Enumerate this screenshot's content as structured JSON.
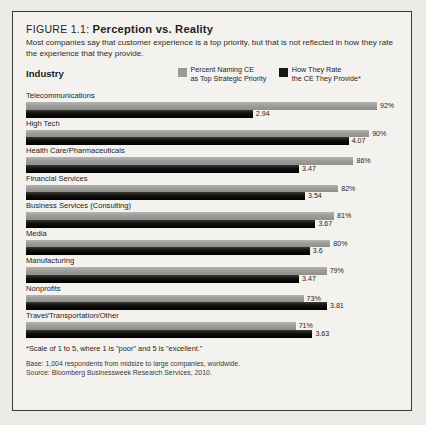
{
  "figure": {
    "number_label": "FIGURE 1.1:",
    "title": "Perception vs. Reality",
    "subtitle": "Most companies say that customer experience is a top priority, but that is not reflected in how they rate the experience that they provide."
  },
  "axis_header": "Industry",
  "legend": {
    "items": [
      {
        "label_line1": "Percent Naming CE",
        "label_line2": "as Top Strategic Priority",
        "color": "#9a9a96",
        "swatch": "gray"
      },
      {
        "label_line1": "How They Rate",
        "label_line2": "the CE They Provide*",
        "color": "#161614",
        "swatch": "black"
      }
    ]
  },
  "footnotes": {
    "scale_note": "*Scale of 1 to 5, where 1 is \"poor\" and 5 is \"excellent.\"",
    "base": "Base: 1,004 respondents from midsize to large companies, worldwide.",
    "source": "Source: Bloomberg Businessweek Research Services, 2010."
  },
  "chart_data": {
    "type": "bar",
    "title": "Perception vs. Reality",
    "subtitle": "Most companies say that customer experience is a top priority, but that is not reflected in how they rate the experience that they provide.",
    "orientation": "horizontal",
    "grid": false,
    "legend_position": "top-right",
    "xlabel": "",
    "ylabel": "Industry",
    "categories": [
      "Telecommunications",
      "High Tech",
      "Health Care/Pharmaceuticals",
      "Financial Services",
      "Business Services (Consulting)",
      "Media",
      "Manufacturing",
      "Nonprofits",
      "Travel/Transportation/Other"
    ],
    "series": [
      {
        "name": "Percent Naming CE as Top Strategic Priority",
        "color": "#9a9a96",
        "unit": "%",
        "axis_max": 100,
        "values": [
          92,
          90,
          86,
          82,
          81,
          80,
          79,
          73,
          71
        ],
        "labels": [
          "92%",
          "90%",
          "86%",
          "82%",
          "81%",
          "80%",
          "79%",
          "73%",
          "71%"
        ]
      },
      {
        "name": "How They Rate the CE They Provide",
        "color": "#161614",
        "unit": "rating",
        "axis_max": 5,
        "scale_note": "Scale of 1 to 5, where 1 is \"poor\" and 5 is \"excellent.\"",
        "values": [
          2.94,
          4.07,
          3.47,
          3.54,
          3.67,
          3.6,
          3.47,
          3.81,
          3.63
        ],
        "labels": [
          "2.94",
          "4.07",
          "3.47",
          "3.54",
          "3.67",
          "3.6",
          "3.47",
          "3.81",
          "3.63"
        ]
      }
    ],
    "rows": [
      {
        "category": "Telecommunications",
        "percent": 92,
        "percent_label": "92%",
        "rating": 2.94,
        "rating_label": "2.94",
        "pct_width": 94.1,
        "rate_width": 60.8
      },
      {
        "category": "High Tech",
        "percent": 90,
        "percent_label": "90%",
        "rating": 4.07,
        "rating_label": "4.07",
        "pct_width": 92.0,
        "rate_width": 86.5
      },
      {
        "category": "Health Care/Pharmaceuticals",
        "percent": 86,
        "percent_label": "86%",
        "rating": 3.47,
        "rating_label": "3.47",
        "pct_width": 87.8,
        "rate_width": 73.2
      },
      {
        "category": "Financial Services",
        "percent": 82,
        "percent_label": "82%",
        "rating": 3.54,
        "rating_label": "3.54",
        "pct_width": 83.7,
        "rate_width": 74.8
      },
      {
        "category": "Business Services (Consulting)",
        "percent": 81,
        "percent_label": "81%",
        "rating": 3.67,
        "rating_label": "3.67",
        "pct_width": 82.6,
        "rate_width": 77.6
      },
      {
        "category": "Media",
        "percent": 80,
        "percent_label": "80%",
        "rating": 3.6,
        "rating_label": "3.6",
        "pct_width": 81.6,
        "rate_width": 76.1
      },
      {
        "category": "Manufacturing",
        "percent": 79,
        "percent_label": "79%",
        "rating": 3.47,
        "rating_label": "3.47",
        "pct_width": 80.6,
        "rate_width": 73.2
      },
      {
        "category": "Nonprofits",
        "percent": 73,
        "percent_label": "73%",
        "rating": 3.81,
        "rating_label": "3.81",
        "pct_width": 74.4,
        "rate_width": 80.7
      },
      {
        "category": "Travel/Transportation/Other",
        "percent": 71,
        "percent_label": "71%",
        "rating": 3.63,
        "rating_label": "3.63",
        "pct_width": 72.3,
        "rate_width": 76.8
      }
    ]
  },
  "colors": {
    "page_background": "#eceae5",
    "panel_background": "#f4f2ee",
    "panel_border": "#3a3a38",
    "series_gray": "#9a9a96",
    "series_black": "#161614",
    "text": "#23231f"
  }
}
